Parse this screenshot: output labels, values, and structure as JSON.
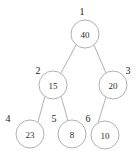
{
  "diagram": {
    "background_color": "#ffffff",
    "node_stroke_color": "#a8a8a8",
    "node_fill_color": "#ffffff",
    "text_color": "#2b2b2b",
    "index_text_color": "#1a1a1a",
    "node_radius": 14
  },
  "nodes": [
    {
      "index": "1",
      "value": "40",
      "cx": 85,
      "cy": 34,
      "index_x": 82,
      "index_y": 11
    },
    {
      "index": "2",
      "value": "15",
      "cx": 53,
      "cy": 85,
      "index_x": 38,
      "index_y": 70
    },
    {
      "index": "3",
      "value": "20",
      "cx": 113,
      "cy": 85,
      "index_x": 128,
      "index_y": 70
    },
    {
      "index": "4",
      "value": "23",
      "cx": 30,
      "cy": 134,
      "index_x": 8,
      "index_y": 118
    },
    {
      "index": "5",
      "value": "8",
      "cx": 72,
      "cy": 134,
      "index_x": 54,
      "index_y": 118
    },
    {
      "index": "6",
      "value": "10",
      "cx": 105,
      "cy": 135,
      "index_x": 88,
      "index_y": 118
    }
  ],
  "edges": [
    {
      "from": "1",
      "to": "2",
      "x1": 76,
      "y1": 45,
      "x2": 61,
      "y2": 73
    },
    {
      "from": "1",
      "to": "3",
      "x1": 94,
      "y1": 45,
      "x2": 106,
      "y2": 73
    },
    {
      "from": "2",
      "to": "4",
      "x1": 45,
      "y1": 96,
      "x2": 38,
      "y2": 122
    },
    {
      "from": "2",
      "to": "5",
      "x1": 61,
      "y1": 96,
      "x2": 68,
      "y2": 121
    },
    {
      "from": "3",
      "to": "6",
      "x1": 106,
      "y1": 97,
      "x2": 98,
      "y2": 123
    }
  ]
}
